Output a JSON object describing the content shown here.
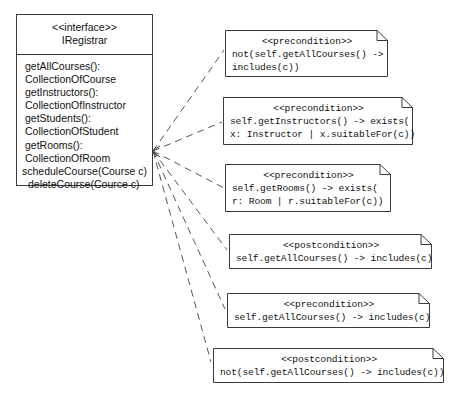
{
  "diagram": {
    "type": "uml-class-diagram-with-constraint-notes",
    "interface": {
      "stereotype": "<<interface>>",
      "name": "IRegistrar",
      "operations": [
        "getAllCourses():",
        "CollectionOfCourse",
        "getInstructors():",
        "CollectionOfInstructor",
        "getStudents():",
        "CollectionOfStudent",
        "getRooms():",
        "CollectionOfRoom",
        "scheduleCourse(Course c)",
        "deleteCourse(Cource c)"
      ]
    },
    "notes": [
      {
        "stereotype": "<<precondition>>",
        "lines": [
          "not(self.getAllCourses() ->",
          "includes(c))"
        ]
      },
      {
        "stereotype": "<<precondition>>",
        "lines": [
          "self.getInstructors() -> exists(",
          "x: Instructor | x.suitableFor(c))"
        ]
      },
      {
        "stereotype": "<<precondition>>",
        "lines": [
          "self.getRooms() -> exists(",
          "r: Room | r.suitableFor(c))"
        ]
      },
      {
        "stereotype": "<<postcondition>>",
        "lines": [
          "self.getAllCourses() -> includes(c)"
        ]
      },
      {
        "stereotype": "<<precondition>>",
        "lines": [
          "self.getAllCourses() -> includes(c)"
        ]
      },
      {
        "stereotype": "<<postcondition>>",
        "lines": [
          "not(self.getAllCourses() -> includes(c))"
        ]
      }
    ],
    "colors": {
      "line": "#3a3a3a",
      "connector": "#555555",
      "text": "#111111",
      "background": "#ffffff"
    }
  }
}
